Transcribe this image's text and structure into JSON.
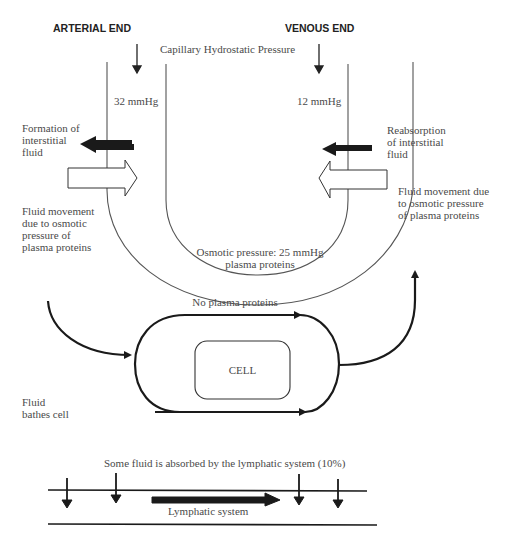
{
  "headers": {
    "arterial_end": "ARTERIAL END",
    "venous_end": "VENOUS END"
  },
  "capillary": {
    "hydrostatic_label": "Capillary Hydrostatic Pressure",
    "arterial_pressure": "32 mmHg",
    "venous_pressure": "12 mmHg"
  },
  "left_labels": {
    "formation": "Formation of\ninterstitial\nfluid",
    "osmotic_movement": "Fluid movement\ndue to osmotic\npressure of\nplasma proteins"
  },
  "right_labels": {
    "reabsorption": "Reabsorption\nof interstitial\nfluid",
    "osmotic_movement": "Fluid movement due\nto osmotic pressure\nof plasma proteins"
  },
  "osmotic": {
    "line1": "Osmotic pressure: 25 mmHg",
    "line2": "plasma proteins"
  },
  "cell_section": {
    "no_proteins": "No plasma proteins",
    "cell_label": "CELL",
    "bathes": "Fluid\nbathes cell"
  },
  "lymphatic": {
    "caption": "Some fluid is absorbed by the lymphatic system (10%)",
    "label": "Lymphatic system"
  },
  "colors": {
    "line": "#555555",
    "arrow_dark": "#1a1a1a",
    "text": "#4a4a4a"
  }
}
